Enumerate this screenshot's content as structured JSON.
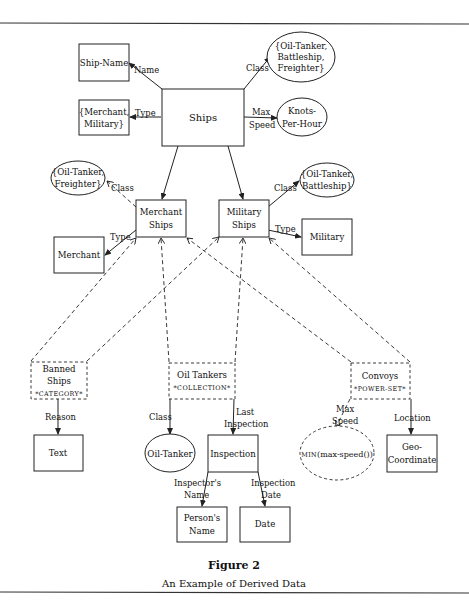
{
  "figure": {
    "title": "Figure 2",
    "caption": "An Example of Derived Data"
  },
  "nodes": {
    "ships": "Ships",
    "ship_name": "Ship-Name",
    "class_set_top": [
      "{Oil-Tanker,",
      "Battleship,",
      "Freighter}"
    ],
    "type_set": [
      "{Merchant,",
      "Military}"
    ],
    "knots": [
      "Knots-",
      "Per-Hour"
    ],
    "merchant_ships": [
      "Merchant",
      "Ships"
    ],
    "military_ships": [
      "Military",
      "Ships"
    ],
    "merchant_class": [
      "{Oil-Tanker,",
      "Freighter}"
    ],
    "military_class": [
      "{Oil-Tanker,",
      "Battleship}"
    ],
    "merchant": "Merchant",
    "military": "Military",
    "banned_ships": [
      "Banned",
      "Ships",
      "*CATEGORY*"
    ],
    "oil_tankers": [
      "Oil Tankers",
      "*COLLECTION*"
    ],
    "convoys": [
      "Convoys",
      "*POWER-SET*"
    ],
    "text": "Text",
    "oil_tanker": "Oil-Tanker",
    "inspection": "Inspection",
    "min_max_speed": "MIN(max-speed())",
    "min_prefix": "MIN",
    "min_rest": "(max-speed())",
    "geo": [
      "Geo-",
      "Coordinate"
    ],
    "persons_name": [
      "Person's",
      "Name"
    ],
    "date": "Date"
  },
  "edges": {
    "name": "Name",
    "class": "Class",
    "type": "Type",
    "max_speed": [
      "Max",
      "Speed"
    ],
    "reason": "Reason",
    "last_inspection": [
      "Last",
      "Inspection"
    ],
    "location": "Location",
    "inspectors_name": [
      "Inspector's",
      "Name"
    ],
    "inspection_date": [
      "Inspection",
      "Date"
    ]
  }
}
